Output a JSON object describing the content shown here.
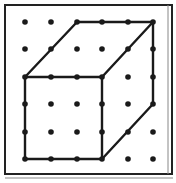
{
  "diagram": {
    "frame": {
      "x1": 5,
      "y1": 5,
      "x2": 172,
      "y2": 174,
      "color": "#222222"
    },
    "grid": {
      "columns": [
        25,
        51,
        77,
        102,
        128,
        153
      ],
      "rows": [
        22,
        49,
        77,
        104,
        132,
        159
      ],
      "dot_radius": 2.8,
      "dot_color": "#1a1a1a"
    },
    "cube": {
      "line_color": "#1a1a1a",
      "line_width": 2.4,
      "front_face": [
        [
          25,
          77
        ],
        [
          102,
          77
        ],
        [
          102,
          159
        ],
        [
          25,
          159
        ]
      ],
      "edges": [
        [
          [
            25,
            77
          ],
          [
            77,
            22
          ]
        ],
        [
          [
            77,
            22
          ],
          [
            153,
            22
          ]
        ],
        [
          [
            153,
            22
          ],
          [
            102,
            77
          ]
        ],
        [
          [
            153,
            22
          ],
          [
            153,
            104
          ]
        ],
        [
          [
            153,
            104
          ],
          [
            102,
            159
          ]
        ]
      ]
    }
  }
}
